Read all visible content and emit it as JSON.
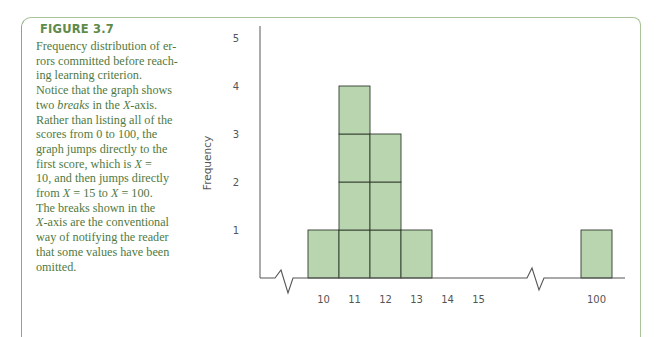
{
  "figure": {
    "label": "FIGURE 3.7",
    "caption_lines": [
      "Frequency distribution of er-",
      "rors committed before reach-",
      "ing learning criterion.",
      "Notice that the graph shows",
      "two |breaks| in the |X|-axis.",
      "Rather than listing all of the",
      "scores from 0 to 100, the",
      "graph jumps directly to the",
      "first score, which is |X| =",
      "10, and then jumps directly",
      "from |X| = 15 to |X| = 100.",
      "The breaks shown in the",
      "|X|-axis are the conventional",
      "way of notifying the reader",
      "that some values have been",
      "omitted."
    ]
  },
  "colors": {
    "bar_fill": "#b9d5b0",
    "bar_stroke": "#2f3a2c",
    "frame": "#a9c49a",
    "caption_text": "#4f7a3f",
    "label_text": "#5e8a4a"
  },
  "chart_data": {
    "type": "bar",
    "xlabel": "",
    "ylabel": "Frequency",
    "categories": [
      "10",
      "11",
      "12",
      "13",
      "14",
      "15",
      "100"
    ],
    "values": [
      1,
      4,
      3,
      1,
      0,
      0,
      1
    ],
    "yticks": [
      "1",
      "2",
      "3",
      "4",
      "5"
    ],
    "ylim": [
      0,
      5
    ],
    "grid": false,
    "legend": "none",
    "axis_breaks": [
      "between 0 and 10",
      "between 15 and 100"
    ],
    "style": "stacked unit blocks (each frequency unit drawn as a separate box)"
  }
}
